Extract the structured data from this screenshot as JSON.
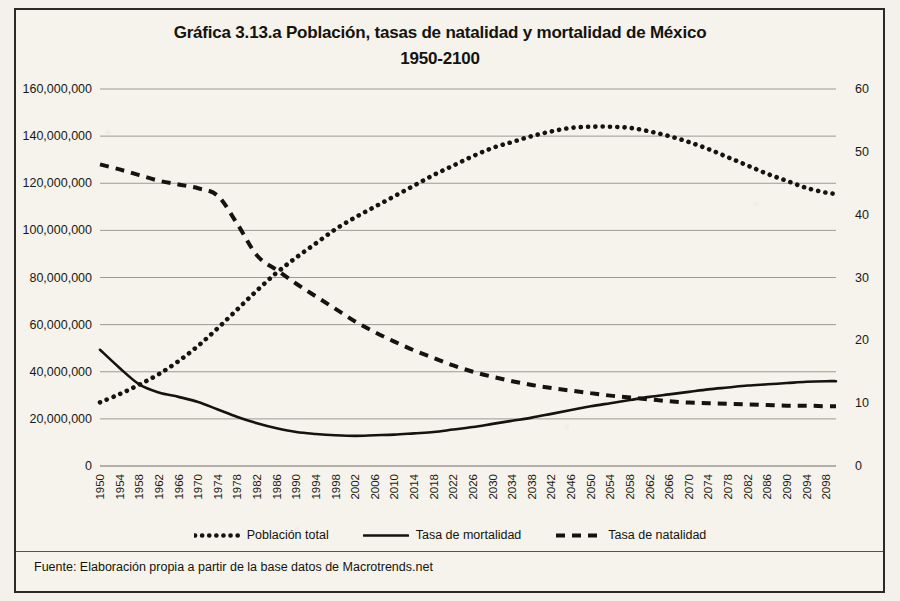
{
  "title_line1": "Gráfica 3.13.a Población, tasas de natalidad y mortalidad de México",
  "title_line2": "1950-2100",
  "source_note": "Fuente: Elaboración propia a partir de la base datos de Macrotrends.net",
  "colors": {
    "ink": "#14130f",
    "gridline": "#9c9a92",
    "paper": "#f5f3eb",
    "frame": "#2b2a26"
  },
  "legend": [
    {
      "label": "Población total",
      "style": "dotted"
    },
    {
      "label": "Tasa de mortalidad",
      "style": "solid"
    },
    {
      "label": "Tasa de natalidad",
      "style": "dashed"
    }
  ],
  "chart_data": {
    "type": "line",
    "title": "Gráfica 3.13.a Población, tasas de natalidad y mortalidad de México 1950-2100",
    "xlabel": "",
    "ylabel": "",
    "y2label": "",
    "grid": true,
    "legend_position": "bottom",
    "xlim": [
      1950,
      2100
    ],
    "ylim": [
      0,
      160000000
    ],
    "y2lim": [
      0,
      60
    ],
    "yticks": [
      0,
      20000000,
      40000000,
      60000000,
      80000000,
      100000000,
      120000000,
      140000000,
      160000000
    ],
    "ytick_labels": [
      "0",
      "20,000,000",
      "40,000,000",
      "60,000,000",
      "80,000,000",
      "100,000,000",
      "120,000,000",
      "140,000,000",
      "160,000,000"
    ],
    "y2ticks": [
      0,
      10,
      20,
      30,
      40,
      50,
      60
    ],
    "y2tick_labels": [
      "0",
      "10",
      "20",
      "30",
      "40",
      "50",
      "60"
    ],
    "xtick_labels": [
      "1950",
      "1954",
      "1958",
      "1962",
      "1966",
      "1970",
      "1974",
      "1978",
      "1982",
      "1986",
      "1990",
      "1994",
      "1998",
      "2002",
      "2006",
      "2010",
      "2014",
      "2018",
      "2022",
      "2026",
      "2030",
      "2034",
      "2038",
      "2042",
      "2046",
      "2050",
      "2054",
      "2058",
      "2062",
      "2066",
      "2070",
      "2074",
      "2078",
      "2082",
      "2086",
      "2090",
      "2094",
      "2098"
    ],
    "x": [
      1950,
      1954,
      1958,
      1962,
      1966,
      1970,
      1974,
      1978,
      1982,
      1986,
      1990,
      1994,
      1998,
      2002,
      2006,
      2010,
      2014,
      2018,
      2022,
      2026,
      2030,
      2034,
      2038,
      2042,
      2046,
      2050,
      2054,
      2058,
      2062,
      2066,
      2070,
      2074,
      2078,
      2082,
      2086,
      2090,
      2094,
      2098,
      2100
    ],
    "series": [
      {
        "name": "Población total",
        "axis": "left",
        "style": "dotted",
        "unit": "habitantes",
        "values": [
          27000000,
          30500000,
          34500000,
          39000000,
          44500000,
          51000000,
          58500000,
          66500000,
          74500000,
          82000000,
          88500000,
          94500000,
          100500000,
          105500000,
          110000000,
          114500000,
          119000000,
          123500000,
          127500000,
          131500000,
          135000000,
          137500000,
          140000000,
          142000000,
          143500000,
          144000000,
          144000000,
          143500000,
          142000000,
          140000000,
          137500000,
          134500000,
          131000000,
          127500000,
          124000000,
          121000000,
          118000000,
          116000000,
          115500000
        ]
      },
      {
        "name": "Tasa de mortalidad",
        "axis": "right",
        "style": "solid",
        "unit": "por 1,000 habitantes",
        "values": [
          18.5,
          15.6,
          13.0,
          11.7,
          11.0,
          10.2,
          9.0,
          7.8,
          6.8,
          6.0,
          5.4,
          5.1,
          4.9,
          4.8,
          4.9,
          5.0,
          5.2,
          5.4,
          5.8,
          6.2,
          6.7,
          7.2,
          7.7,
          8.3,
          8.9,
          9.5,
          10.0,
          10.5,
          11.0,
          11.4,
          11.8,
          12.2,
          12.5,
          12.8,
          13.0,
          13.2,
          13.4,
          13.5,
          13.5
        ]
      },
      {
        "name": "Tasa de natalidad",
        "axis": "right",
        "style": "dashed",
        "unit": "por 1,000 habitantes",
        "values": [
          48.0,
          47.2,
          46.3,
          45.4,
          44.8,
          44.2,
          43.0,
          38.5,
          33.5,
          31.2,
          29.0,
          27.0,
          25.0,
          23.0,
          21.3,
          19.8,
          18.4,
          17.2,
          16.0,
          15.0,
          14.2,
          13.5,
          12.9,
          12.4,
          12.0,
          11.6,
          11.2,
          10.9,
          10.6,
          10.3,
          10.1,
          10.0,
          9.9,
          9.8,
          9.7,
          9.6,
          9.6,
          9.5,
          9.5
        ]
      }
    ]
  }
}
